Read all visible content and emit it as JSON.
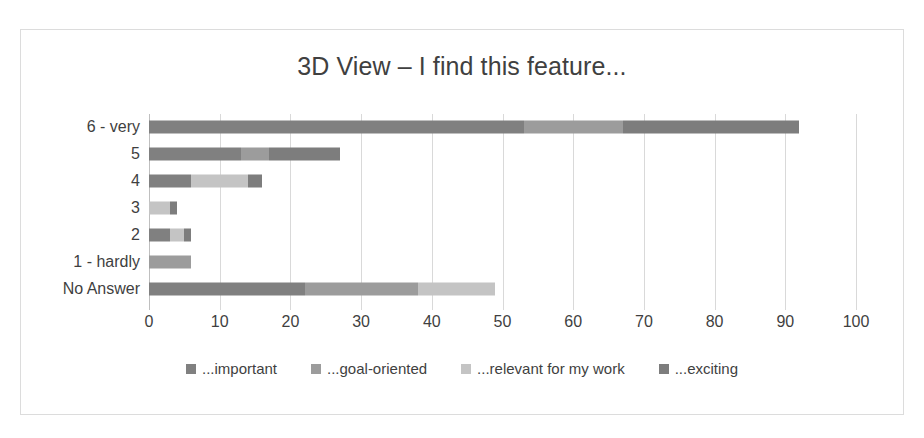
{
  "chart_data": {
    "type": "bar",
    "orientation": "horizontal",
    "stacked": true,
    "title": "3D View – I find this feature...",
    "xlabel": "",
    "ylabel": "",
    "xlim": [
      0,
      100
    ],
    "xticks": [
      0,
      10,
      20,
      30,
      40,
      50,
      60,
      70,
      80,
      90,
      100
    ],
    "xtick_labels": [
      "0",
      "10",
      "20",
      "30",
      "40",
      "50",
      "60",
      "70",
      "80",
      "90",
      "100"
    ],
    "grid": true,
    "grid_axis": "x",
    "legend_position": "bottom",
    "categories": [
      "6 - very",
      "5",
      "4",
      "3",
      "2",
      "1 - hardly",
      "No Answer"
    ],
    "series": [
      {
        "name": "...important",
        "color": "#808080",
        "values": [
          53,
          13,
          6,
          0,
          3,
          0,
          22
        ]
      },
      {
        "name": "...goal-oriented",
        "color": "#9c9c9c",
        "values": [
          14,
          4,
          0,
          0,
          0,
          6,
          16
        ]
      },
      {
        "name": "...relevant for my work",
        "color": "#c4c4c4",
        "values": [
          0,
          0,
          8,
          3,
          2,
          0,
          11
        ]
      },
      {
        "name": "...exciting",
        "color": "#7d7d7d",
        "values": [
          25,
          10,
          2,
          1,
          1,
          0,
          0
        ]
      }
    ],
    "totals": [
      92,
      27,
      16,
      4,
      6,
      6,
      49
    ]
  },
  "colors": {
    "frame_border": "#dcdcdc",
    "gridline": "#d9d9d9",
    "axis": "#bfbfbf",
    "text": "#3f3f3f",
    "title": "#404040",
    "background": "#ffffff"
  }
}
